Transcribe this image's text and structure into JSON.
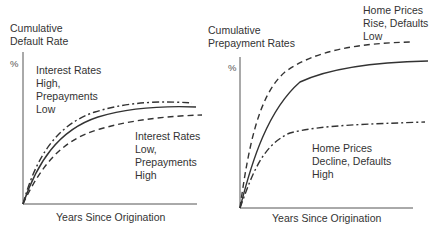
{
  "panels": [
    {
      "title": "Cumulative\nDefault Rate",
      "y_unit": "%",
      "xlabel": "Years Since Origination",
      "annotations": [
        {
          "text": "Interest Rates\nHigh,\nPrepayments\nLow",
          "series": "dash-dot"
        },
        {
          "text": "Interest Rates\nLow,\nPrepayments\nHigh",
          "series": "dashed"
        }
      ]
    },
    {
      "title": "Cumulative\nPrepayment Rates",
      "y_unit": "%",
      "xlabel": "Years Since Origination",
      "annotations": [
        {
          "text": "Home Prices\nRise, Defaults\nLow",
          "series": "dashed"
        },
        {
          "text": "Home Prices\nDecline, Defaults\nHigh",
          "series": "dash-dot"
        }
      ]
    }
  ],
  "colors": {
    "line": "#333333",
    "axis": "#555555",
    "background": "#ffffff"
  }
}
